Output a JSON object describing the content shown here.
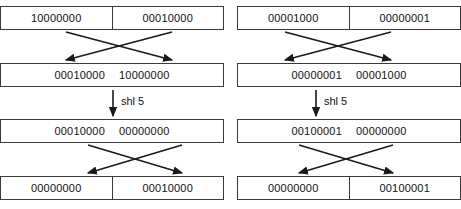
{
  "diagram": {
    "colors": {
      "box_border": "#3a3a3a",
      "arrow": "#1a1a1a",
      "text": "#111111",
      "background": "#ffffff"
    },
    "rows": [
      {
        "name": "initial-operands",
        "style": "divided",
        "left_group": {
          "name": "left-group-row1",
          "cells": [
            "10000000",
            "00010000"
          ]
        },
        "right_group": {
          "name": "right-group-row1",
          "cells": [
            "00001000",
            "00000001"
          ]
        }
      },
      {
        "name": "after-swap-1",
        "style": "merged",
        "left_group": {
          "name": "left-group-row2",
          "cells": [
            "00010000",
            "10000000"
          ]
        },
        "right_group": {
          "name": "right-group-row2",
          "cells": [
            "00000001",
            "00001000"
          ]
        }
      },
      {
        "name": "after-shift",
        "style": "merged",
        "left_group": {
          "name": "left-group-row3",
          "cells": [
            "00010000",
            "00000000"
          ]
        },
        "right_group": {
          "name": "right-group-row3",
          "cells": [
            "00100001",
            "00000000"
          ]
        }
      },
      {
        "name": "after-swap-2",
        "style": "divided",
        "left_group": {
          "name": "left-group-row4",
          "cells": [
            "00000000",
            "00010000"
          ]
        },
        "right_group": {
          "name": "right-group-row4",
          "cells": [
            "00000000",
            "00100001"
          ]
        }
      }
    ],
    "operations": {
      "shift_left_label": "shl 5",
      "shift_left_label_right": "shl 5"
    }
  }
}
